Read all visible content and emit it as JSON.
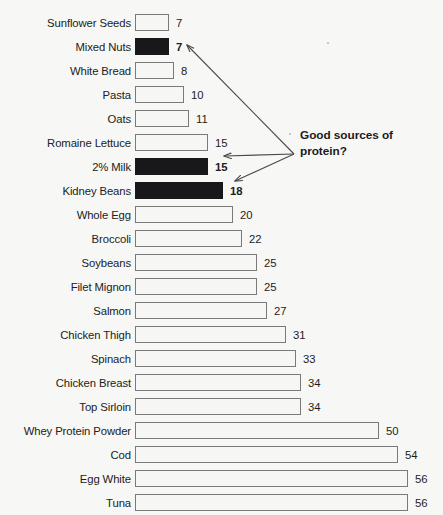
{
  "chart_data": {
    "type": "bar",
    "orientation": "horizontal",
    "title": "",
    "subtitle": "",
    "xlabel": "",
    "ylabel": "",
    "xlim": [
      0,
      56
    ],
    "grid": false,
    "legend": null,
    "categories": [
      "Sunflower Seeds",
      "Mixed Nuts",
      "White Bread",
      "Pasta",
      "Oats",
      "Romaine Lettuce",
      "2% Milk",
      "Kidney Beans",
      "Whole Egg",
      "Broccoli",
      "Soybeans",
      "Filet Mignon",
      "Salmon",
      "Chicken Thigh",
      "Spinach",
      "Chicken Breast",
      "Top Sirloin",
      "Whey Protein Powder",
      "Cod",
      "Egg White",
      "Tuna"
    ],
    "values": [
      7,
      7,
      8,
      10,
      11,
      15,
      15,
      18,
      20,
      22,
      25,
      25,
      27,
      31,
      33,
      34,
      34,
      50,
      54,
      56,
      56
    ],
    "highlighted": [
      false,
      true,
      false,
      false,
      false,
      false,
      true,
      true,
      false,
      false,
      false,
      false,
      false,
      false,
      false,
      false,
      false,
      false,
      false,
      false,
      false
    ],
    "annotations": [
      {
        "text": "Good sources of\nprotein?",
        "points_to": [
          "Mixed Nuts",
          "2% Milk",
          "Kidney Beans"
        ]
      }
    ],
    "colors": {
      "background": "#f7f7f5",
      "bar_fill": "#f6f6f4",
      "bar_stroke": "#7a7a7a",
      "highlight_fill": "#18181a",
      "text": "#1d1d1d",
      "annotation_text": "#1b1b1b",
      "arrow": "#4a4a4a"
    }
  }
}
